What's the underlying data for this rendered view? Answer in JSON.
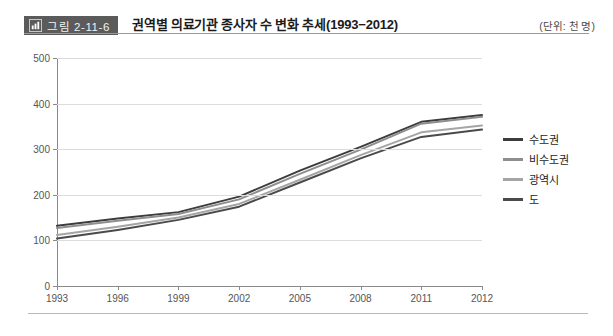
{
  "header": {
    "badge_label": "그림 2-11-6",
    "badge_icon": "bar-chart-icon",
    "title": "권역별 의료기관 종사자 수 변화 추세(1993−2012)",
    "unit_note": "(단위: 천 명)"
  },
  "colors": {
    "series_sudogwon": "#3c3c3c",
    "series_bisudogwon": "#8e8e8e",
    "series_gwangyeoksi": "#a5a5a5",
    "series_do": "#4a4a4a",
    "axis": "#8a8a8a",
    "grid": "#dcdcdc",
    "badge_bg": "#5b5b5b"
  },
  "chart_data": {
    "type": "line",
    "title": "권역별 의료기관 종사자 수 변화 추세(1993−2012)",
    "xlabel": "",
    "ylabel": "",
    "unit": "천 명",
    "grid": true,
    "legend_position": "right",
    "categories": [
      "1993",
      "1996",
      "1999",
      "2002",
      "2005",
      "2008",
      "2011",
      "2012"
    ],
    "x": [
      1993,
      1996,
      1999,
      2002,
      2005,
      2008,
      2011,
      2012
    ],
    "xlim": [
      1993,
      2012
    ],
    "ylim": [
      0,
      500
    ],
    "yticks": [
      0,
      100,
      200,
      300,
      400,
      500
    ],
    "series": [
      {
        "name": "수도권",
        "values": [
          132,
          148,
          162,
          196,
          253,
          305,
          360,
          375
        ]
      },
      {
        "name": "비수도권",
        "values": [
          127,
          143,
          158,
          190,
          246,
          299,
          356,
          371
        ]
      },
      {
        "name": "광역시",
        "values": [
          112,
          130,
          150,
          180,
          233,
          287,
          337,
          352
        ]
      },
      {
        "name": "도",
        "values": [
          104,
          123,
          145,
          174,
          227,
          280,
          327,
          343
        ]
      }
    ]
  },
  "legend": {
    "items": [
      {
        "label": "수도권"
      },
      {
        "label": "비수도권"
      },
      {
        "label": "광역시"
      },
      {
        "label": "도"
      }
    ]
  }
}
